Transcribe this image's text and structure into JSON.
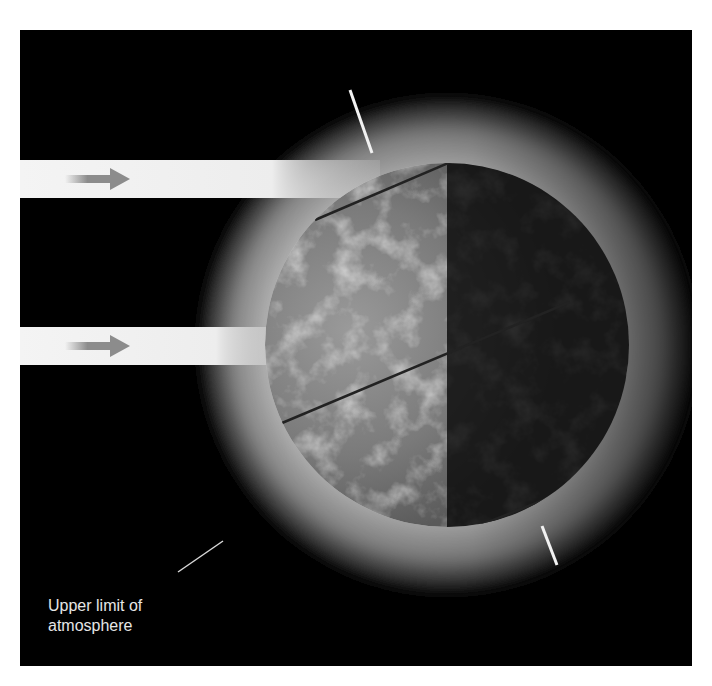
{
  "diagram": {
    "label": {
      "line1": "Upper limit of",
      "line2": "atmosphere"
    },
    "elements": {
      "sun_rays": [
        {
          "id": "ray-upper",
          "direction": "right"
        },
        {
          "id": "ray-lower",
          "direction": "right"
        }
      ],
      "globe": {
        "lit_side": "left",
        "dark_side": "right"
      },
      "axis": "tilted rotation axis",
      "latitude_lines": 3,
      "atmosphere_ring": true
    },
    "colors": {
      "background": "#000000",
      "page": "#ffffff",
      "beam": "#f2f2f2",
      "arrow": "#8c8c8c",
      "label_text": "#e6e6e6"
    }
  }
}
